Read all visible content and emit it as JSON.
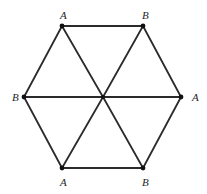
{
  "figure": {
    "background_color": "#ffffff",
    "edge_color": "#2b2b2b",
    "vertex_color": "#111111",
    "label_color": "#262626",
    "width": 207,
    "height": 194
  },
  "chart_data": {
    "type": "diagram",
    "title": "",
    "shape": "regular-hexagon-with-center",
    "grid": false,
    "legend": false,
    "xlim": [
      0,
      207
    ],
    "ylim": [
      0,
      194
    ],
    "nodes": [
      {
        "id": "top-left",
        "label": "A",
        "x": 62,
        "y": 26
      },
      {
        "id": "top-right",
        "label": "B",
        "x": 143,
        "y": 26
      },
      {
        "id": "right",
        "label": "A",
        "x": 181,
        "y": 97
      },
      {
        "id": "bottom-right",
        "label": "B",
        "x": 143,
        "y": 168
      },
      {
        "id": "bottom-left",
        "label": "A",
        "x": 62,
        "y": 168
      },
      {
        "id": "left",
        "label": "B",
        "x": 24,
        "y": 97
      },
      {
        "id": "center",
        "label": "",
        "x": 103,
        "y": 97
      }
    ],
    "edges": [
      {
        "from": "top-left",
        "to": "top-right"
      },
      {
        "from": "top-right",
        "to": "right"
      },
      {
        "from": "right",
        "to": "bottom-right"
      },
      {
        "from": "bottom-right",
        "to": "bottom-left"
      },
      {
        "from": "bottom-left",
        "to": "left"
      },
      {
        "from": "left",
        "to": "top-left"
      },
      {
        "from": "center",
        "to": "top-left"
      },
      {
        "from": "center",
        "to": "top-right"
      },
      {
        "from": "center",
        "to": "right"
      },
      {
        "from": "center",
        "to": "bottom-right"
      },
      {
        "from": "center",
        "to": "bottom-left"
      },
      {
        "from": "center",
        "to": "left"
      }
    ],
    "labels": [
      {
        "text": "A",
        "anchor": "top-left",
        "x": 60,
        "y": 10,
        "align": "center"
      },
      {
        "text": "B",
        "anchor": "top-right",
        "x": 142,
        "y": 10,
        "align": "center"
      },
      {
        "text": "A",
        "anchor": "right",
        "x": 192,
        "y": 92,
        "align": "center"
      },
      {
        "text": "B",
        "anchor": "bottom-right",
        "x": 142,
        "y": 177,
        "align": "center"
      },
      {
        "text": "A",
        "anchor": "bottom-left",
        "x": 60,
        "y": 177,
        "align": "center"
      },
      {
        "text": "B",
        "anchor": "left",
        "x": 12,
        "y": 92,
        "align": "center"
      }
    ]
  }
}
